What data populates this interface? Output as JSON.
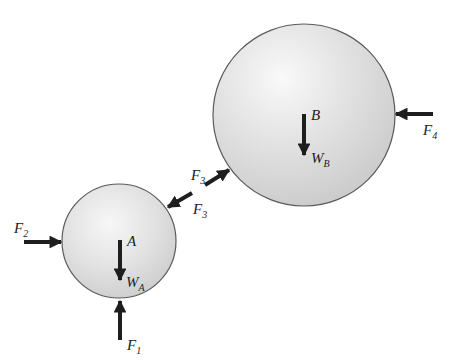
{
  "diagram": {
    "type": "free-body-diagram",
    "colors": {
      "sphere_highlight": "#f7f7f7",
      "sphere_shade": "#d0d0d0",
      "sphere_outline": "#5a5a5a",
      "arrow": "#1e1e1e"
    },
    "bodies": [
      {
        "id": "A",
        "label": "A",
        "cx": 119,
        "cy": 241,
        "r": 57
      },
      {
        "id": "B",
        "label": "B",
        "cx": 304,
        "cy": 115,
        "r": 91
      }
    ],
    "forces": {
      "F1": {
        "main": "F",
        "sub": "1"
      },
      "F2": {
        "main": "F",
        "sub": "2"
      },
      "F3_on_B": {
        "main": "F",
        "sub": "3"
      },
      "F3_on_A": {
        "main": "F",
        "sub": "3"
      },
      "F4": {
        "main": "F",
        "sub": "4"
      },
      "WA": {
        "main": "W",
        "sub": "A"
      },
      "WB": {
        "main": "W",
        "sub": "B"
      }
    }
  }
}
